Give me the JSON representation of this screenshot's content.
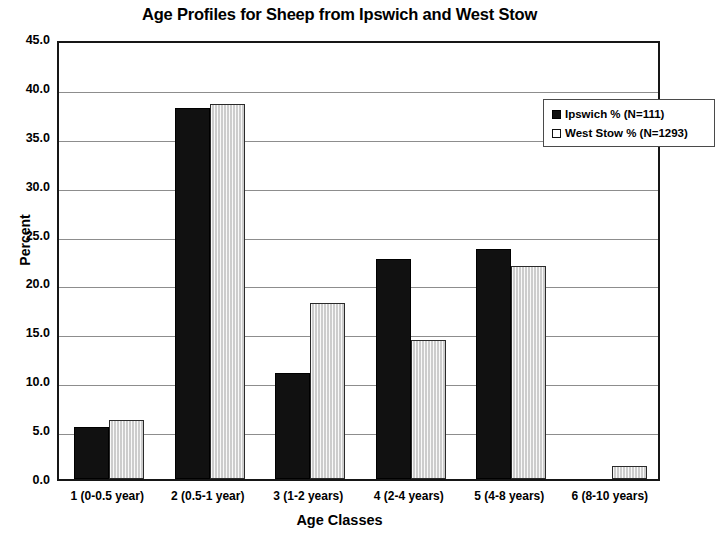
{
  "chart_data": {
    "type": "bar",
    "title": "Age Profiles for Sheep from Ipswich and West Stow",
    "xlabel": "Age Classes",
    "ylabel": "Percent",
    "categories": [
      "1 (0-0.5 year)",
      "2 (0.5-1 year)",
      "3 (1-2 years)",
      "4 (2-4 years)",
      "5 (4-8 years)",
      "6 (8-10 years)"
    ],
    "series": [
      {
        "name": "Ipswich % (N=111)",
        "values": [
          5.3,
          37.9,
          10.8,
          22.5,
          23.5,
          0.0
        ],
        "color": "#111111",
        "swatch": "filled-square"
      },
      {
        "name": "West Stow % (N=1293)",
        "values": [
          6.0,
          38.4,
          18.0,
          14.2,
          21.8,
          1.3
        ],
        "color": "#d9d9d9",
        "swatch": "hollow-square"
      }
    ],
    "ylim": [
      0,
      45
    ],
    "ytick_labels": [
      "45.0",
      "40.0",
      "35.0",
      "30.0",
      "25.0",
      "20.0",
      "15.0",
      "10.0",
      "5.0",
      "0.0"
    ],
    "ytick_values": [
      45,
      40,
      35,
      30,
      25,
      20,
      15,
      10,
      5,
      0
    ],
    "grid": true,
    "legend_position": "top-right"
  }
}
